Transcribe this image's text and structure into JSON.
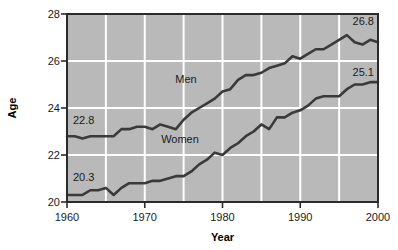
{
  "chart_data": {
    "type": "line",
    "title": "",
    "xlabel": "Year",
    "ylabel": "Age",
    "xlim": [
      1960,
      2000
    ],
    "ylim": [
      20,
      28
    ],
    "xticks": [
      1960,
      1970,
      1980,
      1990,
      2000
    ],
    "yticks": [
      20,
      22,
      24,
      26,
      28
    ],
    "grid": true,
    "legend_position": "inline-annotation",
    "plot_background": "#b9b9b9",
    "line_color": "#3a3a3a",
    "gridline_color": "#ffffff",
    "border_color": "#2b2b2b",
    "x": [
      1960,
      1961,
      1962,
      1963,
      1964,
      1965,
      1966,
      1967,
      1968,
      1969,
      1970,
      1971,
      1972,
      1973,
      1974,
      1975,
      1976,
      1977,
      1978,
      1979,
      1980,
      1981,
      1982,
      1983,
      1984,
      1985,
      1986,
      1987,
      1988,
      1989,
      1990,
      1991,
      1992,
      1993,
      1994,
      1995,
      1996,
      1997,
      1998,
      1999,
      2000
    ],
    "series": [
      {
        "name": "Men",
        "label": "Men",
        "start_label": "22.8",
        "end_label": "26.8",
        "values": [
          22.8,
          22.8,
          22.7,
          22.8,
          22.8,
          22.8,
          22.8,
          23.1,
          23.1,
          23.2,
          23.2,
          23.1,
          23.3,
          23.2,
          23.1,
          23.5,
          23.8,
          24.0,
          24.2,
          24.4,
          24.7,
          24.8,
          25.2,
          25.4,
          25.4,
          25.5,
          25.7,
          25.8,
          25.9,
          26.2,
          26.1,
          26.3,
          26.5,
          26.5,
          26.7,
          26.9,
          27.1,
          26.8,
          26.7,
          26.9,
          26.8
        ]
      },
      {
        "name": "Women",
        "label": "Women",
        "start_label": "20.3",
        "end_label": "25.1",
        "values": [
          20.3,
          20.3,
          20.3,
          20.5,
          20.5,
          20.6,
          20.3,
          20.6,
          20.8,
          20.8,
          20.8,
          20.9,
          20.9,
          21.0,
          21.1,
          21.1,
          21.3,
          21.6,
          21.8,
          22.1,
          22.0,
          22.3,
          22.5,
          22.8,
          23.0,
          23.3,
          23.1,
          23.6,
          23.6,
          23.8,
          23.9,
          24.1,
          24.4,
          24.5,
          24.5,
          24.5,
          24.8,
          25.0,
          25.0,
          25.1,
          25.1
        ]
      }
    ]
  },
  "labels": {
    "y_28": "28",
    "y_26": "26",
    "y_24": "24",
    "y_22": "22",
    "y_20": "20",
    "x_1960": "1960",
    "x_1970": "1970",
    "x_1980": "1980",
    "x_1990": "1990",
    "x_2000": "2000",
    "axis_x_title": "Year",
    "axis_y_title": "Age",
    "men_series": "Men",
    "women_series": "Women",
    "men_start": "22.8",
    "men_end": "26.8",
    "women_start": "20.3",
    "women_end": "25.1"
  }
}
